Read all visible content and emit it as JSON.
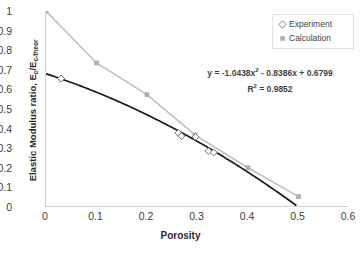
{
  "chart_data": {
    "type": "scatter",
    "title": "",
    "xlabel": "Porosity",
    "ylabel": "Elastic Modulus ratio, E c/E c-theor",
    "ylabel_main": "Elastic Modulus ratio, E",
    "ylabel_sub1": "c",
    "ylabel_mid": "/E",
    "ylabel_sub2": "c-theor",
    "xlim": [
      0,
      0.6
    ],
    "ylim": [
      0,
      1
    ],
    "xticks": [
      "0",
      "0.1",
      "0.2",
      "0.3",
      "0.4",
      "0.5",
      "0.6"
    ],
    "xtick_values": [
      0,
      0.1,
      0.2,
      0.3,
      0.4,
      0.5,
      0.6
    ],
    "yticks": [
      "0",
      "0.1",
      "0.2",
      "0.3",
      "0.4",
      "0.5",
      "0.6",
      "0.7",
      "0.8",
      "0.9",
      "1"
    ],
    "ytick_values": [
      0,
      0.1,
      0.2,
      0.3,
      0.4,
      0.5,
      0.6,
      0.7,
      0.8,
      0.9,
      1
    ],
    "grid": false,
    "legend_position": "top-right",
    "series": [
      {
        "name": "Experiment",
        "marker": "open-diamond",
        "color": "#7f7f7f",
        "x": [
          0.03,
          0.262,
          0.268,
          0.296,
          0.322,
          0.332
        ],
        "y": [
          0.655,
          0.378,
          0.362,
          0.358,
          0.285,
          0.278
        ]
      },
      {
        "name": "Calculation",
        "marker": "filled-square",
        "color": "#bfbfbf",
        "x": [
          0.0,
          0.1,
          0.2,
          0.295,
          0.4,
          0.5
        ],
        "y": [
          1.0,
          0.735,
          0.573,
          0.368,
          0.2,
          0.053
        ]
      }
    ],
    "trendline": {
      "series": "Experiment",
      "type": "polynomial-2",
      "color": "#1a1a1a",
      "a": -1.0438,
      "b": -0.8386,
      "c": 0.6799,
      "x_start": 0,
      "x_end": 0.5
    },
    "annotations": {
      "equation_prefix": "y = -1.0438x",
      "equation_sup": "2",
      "equation_rest": " - 0.8386x + 0.6799",
      "r2_prefix": "R",
      "r2_sup": "2",
      "r2_rest": " = 0.9852"
    }
  },
  "legend": {
    "items": [
      {
        "label": "Experiment"
      },
      {
        "label": "Calculation"
      }
    ]
  }
}
